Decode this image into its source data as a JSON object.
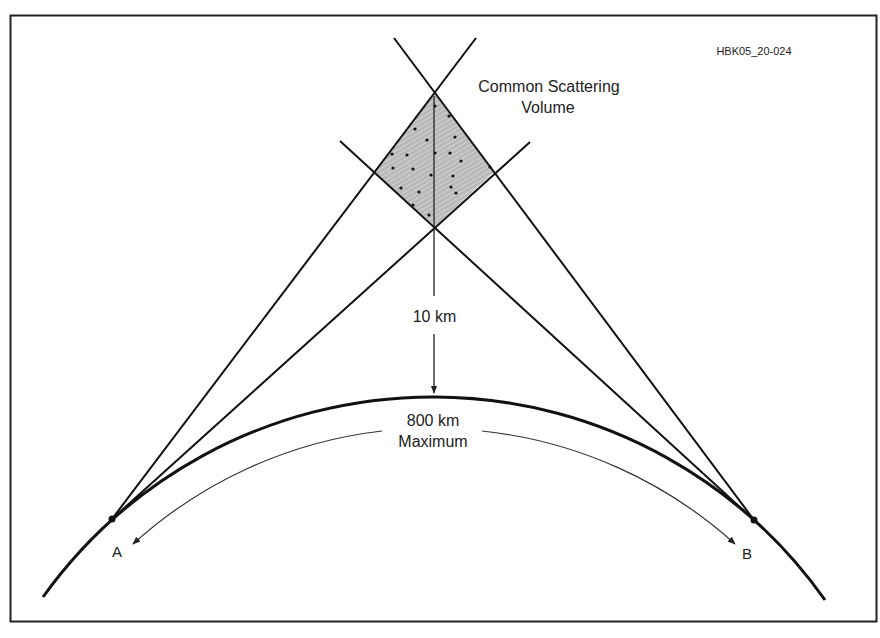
{
  "figure_id": "HBK05_20-024",
  "labels": {
    "scatter_volume_line1": "Common Scattering",
    "scatter_volume_line2": "Volume",
    "height": "10 km",
    "distance_line1": "800 km",
    "distance_line2": "Maximum",
    "point_a": "A",
    "point_b": "B"
  },
  "colors": {
    "line": "#111111",
    "volume_fill": "#b9b9b9",
    "hatch": "#e6e6e6",
    "text": "#222222",
    "background": "#ffffff"
  },
  "geometry": {
    "earth_curve": {
      "center": [
        434,
        875
      ],
      "radius": 480
    },
    "distance_arc": {
      "center": [
        434,
        875
      ],
      "radius": 447
    },
    "point_a": [
      112,
      519
    ],
    "point_b": [
      754,
      520
    ],
    "volume_top": [
      435,
      93
    ],
    "volume_bottom": [
      435,
      226
    ],
    "volume_left": [
      374,
      172
    ],
    "volume_right": [
      494,
      172
    ]
  }
}
